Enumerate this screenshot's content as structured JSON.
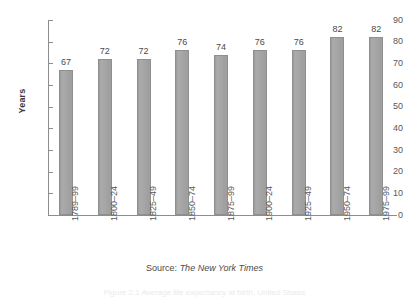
{
  "chart_data": {
    "type": "bar",
    "title": "",
    "xlabel": "",
    "ylabel": "Years",
    "ylim": [
      0,
      90
    ],
    "ytick_step": 10,
    "yticks": [
      90,
      80,
      70,
      60,
      50,
      40,
      30,
      20,
      10,
      0
    ],
    "grid": false,
    "legend": "none",
    "categories": [
      "1789–99",
      "1800–24",
      "1825–49",
      "1850–74",
      "1875–99",
      "1900–24",
      "1925–49",
      "1950–74",
      "1975–99"
    ],
    "values": [
      67,
      72,
      72,
      76,
      74,
      76,
      76,
      82,
      82
    ],
    "value_labels": [
      "67",
      "72",
      "72",
      "76",
      "74",
      "76",
      "76",
      "82",
      "82"
    ],
    "bar_color": "#a3a3a3",
    "bar_edge_color": "#8f8f8f",
    "axis_color": "#8d8d8d",
    "text_color": "#585858"
  },
  "source": {
    "label": "Source:",
    "name": "The New York Times"
  },
  "caption_fragment": {
    "text": "Figure 2.1  Average life expectancy at birth, United States"
  }
}
